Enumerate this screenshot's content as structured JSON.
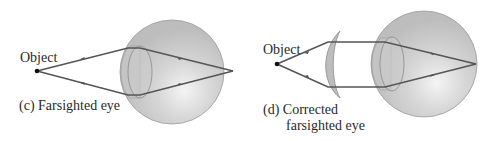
{
  "panels": [
    {
      "id": "c",
      "object_label": "Object",
      "caption": "(c) Farsighted eye"
    },
    {
      "id": "d",
      "object_label": "Object",
      "caption_line1": "(d) Corrected",
      "caption_line2": "farsighted eye"
    }
  ],
  "colors": {
    "ray": "#555555",
    "eyeball_fill": "#c9c9c9",
    "eyeball_stroke": "#8a8a8a",
    "lens_fill": "#b8b8b8",
    "text": "#2a2a2a"
  }
}
